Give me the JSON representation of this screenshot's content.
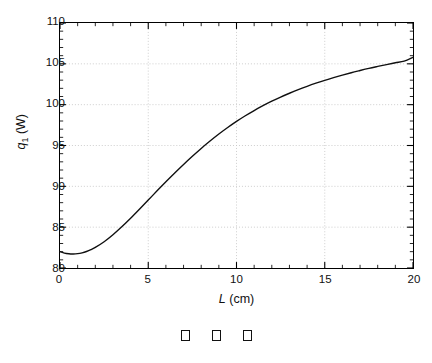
{
  "chart_data": {
    "type": "line",
    "title": "",
    "subtitle": "",
    "xlabel": "L (cm)",
    "xlabel_symbol": "L",
    "xlabel_unit": "(cm)",
    "ylabel": "q1 (W)",
    "ylabel_symbol": "q",
    "ylabel_subscript": "1",
    "ylabel_unit": "(W)",
    "xlim": [
      0,
      20
    ],
    "ylim": [
      80,
      110
    ],
    "xticks": [
      0,
      5,
      10,
      15,
      20
    ],
    "yticks": [
      80,
      85,
      90,
      95,
      100,
      105,
      110
    ],
    "xtick_labels": [
      "0",
      "5",
      "10",
      "15",
      "20"
    ],
    "ytick_labels": [
      "80",
      "85",
      "90",
      "95",
      "100",
      "105",
      "110"
    ],
    "x_minor_tick_interval": 1,
    "y_minor_tick_interval": 1,
    "grid": true,
    "grid_style": "dotted",
    "grid_color": "#c8c8c8",
    "legend": null,
    "legend_position": "none",
    "line_color": "#101010",
    "line_width": 1.4,
    "series": [
      {
        "name": "q1",
        "x": [
          0.0,
          0.25,
          0.5,
          0.75,
          1.0,
          1.25,
          1.5,
          1.75,
          2.0,
          2.5,
          3.0,
          3.5,
          4.0,
          4.5,
          5.0,
          5.5,
          6.0,
          6.5,
          7.0,
          7.5,
          8.0,
          8.5,
          9.0,
          9.5,
          10.0,
          10.5,
          11.0,
          11.5,
          12.0,
          12.5,
          13.0,
          13.5,
          14.0,
          14.5,
          15.0,
          15.5,
          16.0,
          16.5,
          17.0,
          17.5,
          18.0,
          18.5,
          19.0,
          19.5,
          20.0
        ],
        "y": [
          82.0,
          81.82,
          81.74,
          81.72,
          81.76,
          81.86,
          82.02,
          82.24,
          82.52,
          83.22,
          84.08,
          85.05,
          86.1,
          87.2,
          88.32,
          89.45,
          90.56,
          91.64,
          92.68,
          93.68,
          94.64,
          95.54,
          96.4,
          97.2,
          97.95,
          98.64,
          99.28,
          99.87,
          100.42,
          100.93,
          101.4,
          101.84,
          102.25,
          102.63,
          102.98,
          103.31,
          103.62,
          103.91,
          104.18,
          104.44,
          104.68,
          104.91,
          105.13,
          105.34,
          105.8
        ]
      }
    ],
    "annotations": []
  },
  "caption": {
    "glyphs": [
      "missing-glyph-box",
      "missing-glyph-box",
      "missing-glyph-box"
    ],
    "count": 3
  },
  "colors": {
    "background": "#ffffff",
    "axis": "#000000",
    "text": "#111111",
    "grid": "#c8c8c8",
    "curve": "#101010"
  }
}
